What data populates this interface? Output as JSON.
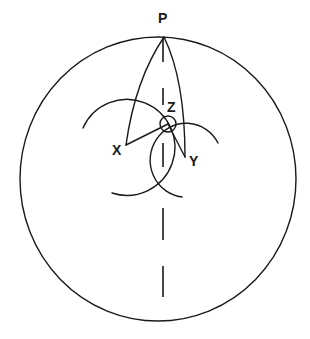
{
  "diagram": {
    "labels": {
      "p": "P",
      "x": "X",
      "y": "Y",
      "z": "Z"
    },
    "colors": {
      "line": "#1a1a1a",
      "background": "#ffffff"
    },
    "elements": [
      "outer-circle",
      "vertical-dashed-diameter",
      "lune-from-P",
      "arc-centered-X",
      "arc-centered-Y",
      "small-circle-Z",
      "segment-X-Z",
      "segment-Z-Y"
    ]
  }
}
